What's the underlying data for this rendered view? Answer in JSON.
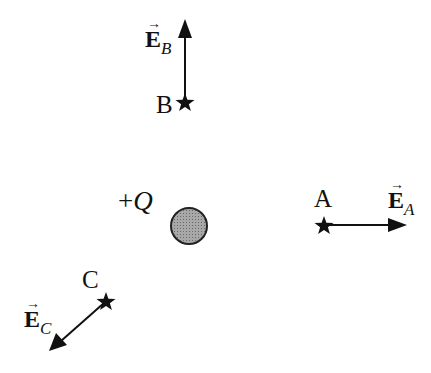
{
  "diagram": {
    "charge": {
      "label_sign": "+",
      "label_symbol": "Q",
      "fill": "#999999",
      "cx": 189,
      "cy": 226,
      "r": 18
    },
    "points": [
      {
        "id": "A",
        "label": "A",
        "field_label": "E",
        "field_sub": "A",
        "star": [
          324,
          225
        ],
        "tip": [
          406,
          225
        ]
      },
      {
        "id": "B",
        "label": "B",
        "field_label": "E",
        "field_sub": "B",
        "star": [
          185,
          102
        ],
        "tip": [
          185,
          20
        ]
      },
      {
        "id": "C",
        "label": "C",
        "field_label": "E",
        "field_sub": "C",
        "star": [
          106,
          301
        ],
        "tip": [
          50,
          350
        ]
      }
    ],
    "vector_arrow_glyph": "→",
    "colors": {
      "ink": "#111111",
      "charge_fill": "#999999"
    }
  }
}
